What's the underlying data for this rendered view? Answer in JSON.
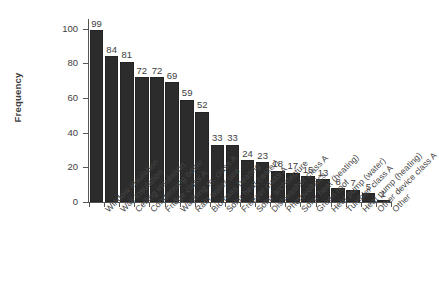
{
  "chart_data": {
    "type": "bar",
    "title": "",
    "xlabel": "",
    "ylabel": "Frequency",
    "ylim": [
      0,
      105
    ],
    "yticks": [
      0,
      20,
      40,
      60,
      80,
      100
    ],
    "grid": false,
    "legend": "none",
    "bar_color": "#2c2c2c",
    "value_labels": true,
    "categories": [
      "Window insulation",
      "Wall insulation",
      "Ceiling insulation",
      "Condensing boiler",
      "Fridge class A",
      "Washing m. class A",
      "Rain water use",
      "Biomass heating",
      "Solar heat (water)",
      "Freezer class A",
      "Solar architecture",
      "Dishwasher class A",
      "Photovoltaics",
      "Solar heat (heating)",
      "Green roof",
      "Heat pump (water)",
      "Tumbler class A",
      "Heat pump (heating)",
      "Other device class A",
      "Other"
    ],
    "values": [
      99,
      84,
      81,
      72,
      72,
      69,
      59,
      52,
      33,
      33,
      24,
      23,
      18,
      17,
      15,
      13,
      8,
      7,
      5,
      1
    ]
  }
}
